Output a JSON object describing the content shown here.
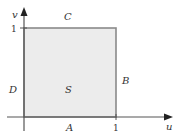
{
  "diagram": {
    "axes": {
      "horizontal_label": "u",
      "vertical_label": "v",
      "u_tick_label": "1",
      "v_tick_label": "1"
    },
    "region": {
      "label": "S",
      "u_range": [
        0,
        1
      ],
      "v_range": [
        0,
        1
      ],
      "fill_color": "#ececec",
      "edge_color": "#8a8a8a"
    },
    "sides": {
      "bottom": "A",
      "right": "B",
      "top": "C",
      "left": "D"
    },
    "colors": {
      "axis": "#555555",
      "text": "#333333"
    }
  }
}
